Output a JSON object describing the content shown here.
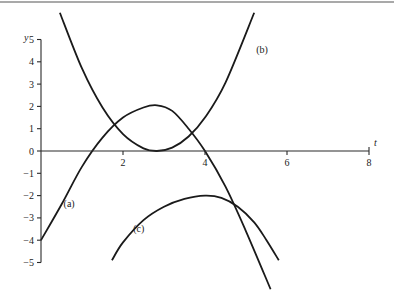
{
  "chart_data": {
    "type": "line",
    "title": "",
    "xlabel": "t",
    "ylabel": "y",
    "xlim": [
      0,
      8
    ],
    "ylim": [
      -5,
      5
    ],
    "x_ticks": [
      2,
      4,
      6,
      8
    ],
    "x_tick_labels": [
      "2",
      "4",
      "6",
      "8"
    ],
    "y_ticks": [
      5,
      4,
      3,
      2,
      1,
      0,
      -1,
      -2,
      -3,
      -4,
      -5
    ],
    "y_tick_labels": [
      "5",
      "4",
      "3",
      "2",
      "1",
      "0",
      "−1",
      "−2",
      "−3",
      "−4",
      "−5"
    ],
    "grid": false,
    "legend": "none",
    "series": [
      {
        "name": "(a)",
        "label_at": [
          0.55,
          -2.5
        ],
        "points": [
          [
            0,
            -4
          ],
          [
            0.5,
            -2.4
          ],
          [
            1,
            -0.7
          ],
          [
            1.5,
            0.6
          ],
          [
            2,
            1.5
          ],
          [
            2.5,
            1.95
          ],
          [
            2.83,
            2.05
          ],
          [
            3.2,
            1.8
          ],
          [
            3.6,
            1.0
          ],
          [
            4,
            0
          ],
          [
            4.5,
            -1.6
          ],
          [
            5,
            -3.6
          ],
          [
            5.6,
            -6.2
          ]
        ]
      },
      {
        "name": "(b)",
        "label_at": [
          5.25,
          4.4
        ],
        "points": [
          [
            0.46,
            6.2
          ],
          [
            1,
            3.7
          ],
          [
            1.5,
            1.95
          ],
          [
            2,
            0.76
          ],
          [
            2.5,
            0.12
          ],
          [
            2.83,
            0
          ],
          [
            3.2,
            0.15
          ],
          [
            3.6,
            0.65
          ],
          [
            4,
            1.5
          ],
          [
            4.5,
            3.07
          ],
          [
            5.2,
            6.2
          ]
        ]
      },
      {
        "name": "(c)",
        "label_at": [
          2.25,
          -3.65
        ],
        "points": [
          [
            1.73,
            -4.9
          ],
          [
            2,
            -4.1
          ],
          [
            2.5,
            -3.1
          ],
          [
            3,
            -2.5
          ],
          [
            3.5,
            -2.15
          ],
          [
            4,
            -2.0
          ],
          [
            4.4,
            -2.1
          ],
          [
            4.8,
            -2.5
          ],
          [
            5.2,
            -3.2
          ],
          [
            5.5,
            -4.0
          ],
          [
            5.8,
            -4.9
          ]
        ]
      }
    ]
  }
}
